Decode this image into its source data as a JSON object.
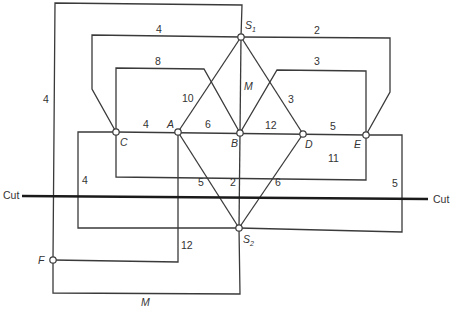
{
  "diagram": {
    "cut_label_left": "Cut",
    "cut_label_right": "Cut",
    "nodes": {
      "S1": "S",
      "S1_sub": "1",
      "S2": "S",
      "S2_sub": "2",
      "A": "A",
      "B": "B",
      "C": "C",
      "D": "D",
      "E": "E",
      "F": "F"
    },
    "edge_labels": {
      "outer_top_left": "4",
      "top_loop_left": "4",
      "top_loop_right": "2",
      "c_to_b": "8",
      "b_to_e": "3",
      "a_to_s1": "10",
      "s1_to_b": "M",
      "s1_to_d": "3",
      "c_to_a": "4",
      "a_to_b": "6",
      "b_to_d": "12",
      "d_to_e": "5",
      "c_to_e_bottom": "11",
      "c_to_s2": "4",
      "a_to_s2": "5",
      "b_to_s2": "2",
      "d_to_s2": "6",
      "e_to_s2": "5",
      "a_to_f": "12",
      "f_to_s2": "M"
    }
  }
}
